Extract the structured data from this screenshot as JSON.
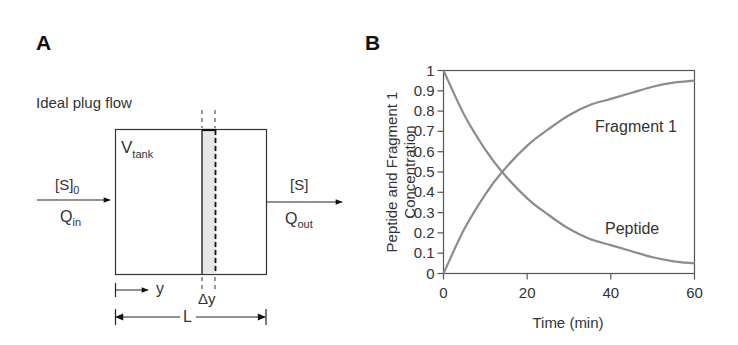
{
  "panel_a": {
    "label": "A",
    "title": "Ideal plug flow",
    "tank_label": "V",
    "tank_label_sub": "tank",
    "inlet_conc": "[S]",
    "inlet_conc_sub": "0",
    "inlet_flow": "Q",
    "inlet_flow_sub": "in",
    "outlet_conc": "[S]",
    "outlet_flow": "Q",
    "outlet_flow_sub": "out",
    "position_label": "y",
    "element_label": "Δy",
    "length_label": "L",
    "shade_color": "#e6e6e6"
  },
  "panel_b": {
    "label": "B",
    "curve_color": "#8c8c8c"
  },
  "chart_data": {
    "type": "line",
    "title": "",
    "xlabel": "Time (min)",
    "ylabel": "Peptide and Fragment 1 Concentration",
    "ylabel_line1": "Peptide and Fragment 1",
    "ylabel_line2": "Concentration",
    "xlim": [
      0,
      60
    ],
    "ylim": [
      0,
      1
    ],
    "xticks": [
      "0",
      "20",
      "40",
      "60"
    ],
    "yticks": [
      "0",
      "0.1",
      "0.2",
      "0.3",
      "0.4",
      "0.5",
      "0.6",
      "0.7",
      "0.8",
      "0.9",
      "1"
    ],
    "grid": false,
    "legend": "inline labels",
    "x": [
      0,
      5,
      10,
      14,
      20,
      25,
      30,
      35,
      40,
      45,
      50,
      55,
      60
    ],
    "series": [
      {
        "name": "Peptide",
        "values": [
          1.0,
          0.78,
          0.61,
          0.5,
          0.37,
          0.29,
          0.22,
          0.17,
          0.14,
          0.11,
          0.08,
          0.06,
          0.05
        ]
      },
      {
        "name": "Fragment 1",
        "values": [
          0.0,
          0.22,
          0.39,
          0.5,
          0.63,
          0.71,
          0.78,
          0.83,
          0.86,
          0.89,
          0.92,
          0.94,
          0.95
        ]
      }
    ],
    "annotations": [
      {
        "text": "Fragment 1",
        "x": 46,
        "y": 0.72
      },
      {
        "text": "Peptide",
        "x": 46,
        "y": 0.22
      }
    ]
  }
}
